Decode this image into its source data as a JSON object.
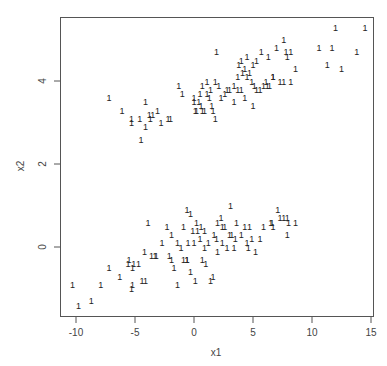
{
  "chart_data": {
    "type": "scatter",
    "title": "",
    "xlabel": "x1",
    "ylabel": "x2",
    "xlim": [
      -11.5,
      15.3
    ],
    "ylim": [
      -1.7,
      5.5
    ],
    "xticks": [
      -10,
      -5,
      0,
      5,
      10,
      15
    ],
    "yticks": [
      0,
      2,
      4
    ],
    "grid": false,
    "legend": null,
    "marker": "1",
    "series": [
      {
        "name": "upper cluster",
        "points": [
          [
            -7.2,
            3.6
          ],
          [
            -6.1,
            3.3
          ],
          [
            -5.3,
            3.1
          ],
          [
            -5.3,
            3.0
          ],
          [
            -4.6,
            3.1
          ],
          [
            -4.1,
            3.5
          ],
          [
            -4.1,
            2.9
          ],
          [
            -3.8,
            3.2
          ],
          [
            -3.7,
            3.1
          ],
          [
            -3.5,
            3.2
          ],
          [
            -3.1,
            3.3
          ],
          [
            -2.8,
            3.0
          ],
          [
            -2.2,
            3.1
          ],
          [
            -2.0,
            3.1
          ],
          [
            -4.5,
            2.6
          ],
          [
            -1.3,
            3.9
          ],
          [
            -1.0,
            3.7
          ],
          [
            0.0,
            3.6
          ],
          [
            0.0,
            3.5
          ],
          [
            0.1,
            3.3
          ],
          [
            0.2,
            3.3
          ],
          [
            0.4,
            3.5
          ],
          [
            0.6,
            3.4
          ],
          [
            0.7,
            3.3
          ],
          [
            0.9,
            3.3
          ],
          [
            1.1,
            3.7
          ],
          [
            1.3,
            3.6
          ],
          [
            1.5,
            3.4
          ],
          [
            1.6,
            3.3
          ],
          [
            1.8,
            3.1
          ],
          [
            0.5,
            3.7
          ],
          [
            0.7,
            3.9
          ],
          [
            1.1,
            4.0
          ],
          [
            1.4,
            3.8
          ],
          [
            1.8,
            4.0
          ],
          [
            2.1,
            3.9
          ],
          [
            2.3,
            3.6
          ],
          [
            2.6,
            3.7
          ],
          [
            2.8,
            3.8
          ],
          [
            3.0,
            3.8
          ],
          [
            3.4,
            3.5
          ],
          [
            3.4,
            3.9
          ],
          [
            3.7,
            3.8
          ],
          [
            4.0,
            3.8
          ],
          [
            4.3,
            3.6
          ],
          [
            1.9,
            4.7
          ],
          [
            3.8,
            4.4
          ],
          [
            4.1,
            4.2
          ],
          [
            4.3,
            4.3
          ],
          [
            4.5,
            4.1
          ],
          [
            4.7,
            4.2
          ],
          [
            4.9,
            4.0
          ],
          [
            5.1,
            3.9
          ],
          [
            5.3,
            3.8
          ],
          [
            5.6,
            3.8
          ],
          [
            5.9,
            3.9
          ],
          [
            6.1,
            4.0
          ],
          [
            6.2,
            3.9
          ],
          [
            6.4,
            3.9
          ],
          [
            6.7,
            4.1
          ],
          [
            3.7,
            4.1
          ],
          [
            4.0,
            4.5
          ],
          [
            4.5,
            4.6
          ],
          [
            5.0,
            4.4
          ],
          [
            5.3,
            4.5
          ],
          [
            5.7,
            4.7
          ],
          [
            6.3,
            4.6
          ],
          [
            7.0,
            4.8
          ],
          [
            7.6,
            5.0
          ],
          [
            7.8,
            4.7
          ],
          [
            7.9,
            4.6
          ],
          [
            8.2,
            4.7
          ],
          [
            8.6,
            4.3
          ],
          [
            10.6,
            4.8
          ],
          [
            11.7,
            4.8
          ],
          [
            7.3,
            4.0
          ],
          [
            7.6,
            4.0
          ],
          [
            8.2,
            4.0
          ],
          [
            5.0,
            3.4
          ],
          [
            6.7,
            4.1
          ],
          [
            11.3,
            4.4
          ],
          [
            12.5,
            4.3
          ],
          [
            13.8,
            4.7
          ],
          [
            12.0,
            5.3
          ],
          [
            14.5,
            5.3
          ]
        ]
      },
      {
        "name": "lower cluster",
        "points": [
          [
            -10.3,
            -0.9
          ],
          [
            -9.8,
            -1.4
          ],
          [
            -8.7,
            -1.3
          ],
          [
            -7.9,
            -0.9
          ],
          [
            -7.2,
            -0.5
          ],
          [
            -6.3,
            -0.7
          ],
          [
            -5.6,
            -0.4
          ],
          [
            -5.5,
            -0.3
          ],
          [
            -5.2,
            -0.5
          ],
          [
            -5.1,
            -0.4
          ],
          [
            -5.2,
            -0.9
          ],
          [
            -5.3,
            -1.0
          ],
          [
            -4.7,
            -0.4
          ],
          [
            -4.4,
            -0.8
          ],
          [
            -4.1,
            -0.8
          ],
          [
            -3.9,
            0.6
          ],
          [
            -4.2,
            -0.1
          ],
          [
            -3.6,
            -0.2
          ],
          [
            -3.3,
            -0.2
          ],
          [
            -3.2,
            -0.2
          ],
          [
            -2.7,
            0.1
          ],
          [
            -2.3,
            0.5
          ],
          [
            -2.1,
            -0.2
          ],
          [
            -1.9,
            -0.3
          ],
          [
            -1.9,
            0.3
          ],
          [
            -1.7,
            -0.5
          ],
          [
            -1.4,
            0.1
          ],
          [
            -1.1,
            0.0
          ],
          [
            -0.9,
            -0.3
          ],
          [
            -0.6,
            -0.3
          ],
          [
            -0.9,
            0.5
          ],
          [
            -0.6,
            0.9
          ],
          [
            -0.3,
            0.8
          ],
          [
            -0.5,
            0.1
          ],
          [
            -0.6,
            -0.3
          ],
          [
            -0.3,
            -0.6
          ],
          [
            -0.1,
            0.4
          ],
          [
            0.0,
            0.1
          ],
          [
            0.2,
            0.6
          ],
          [
            0.3,
            0.4
          ],
          [
            0.5,
            0.2
          ],
          [
            0.6,
            0.5
          ],
          [
            0.9,
            0.4
          ],
          [
            0.9,
            0.0
          ],
          [
            -1.4,
            -0.9
          ],
          [
            1.0,
            -0.4
          ],
          [
            1.2,
            0.1
          ],
          [
            1.4,
            -0.8
          ],
          [
            1.6,
            -0.7
          ],
          [
            1.9,
            0.2
          ],
          [
            2.0,
            -0.1
          ],
          [
            2.3,
            0.7
          ],
          [
            2.4,
            0.1
          ],
          [
            2.6,
            0.5
          ],
          [
            2.8,
            0.0
          ],
          [
            3.0,
            0.3
          ],
          [
            3.2,
            0.3
          ],
          [
            3.4,
            0.0
          ],
          [
            3.5,
            0.2
          ],
          [
            3.6,
            0.6
          ],
          [
            3.1,
            1.0
          ],
          [
            4.0,
            0.3
          ],
          [
            4.3,
            0.5
          ],
          [
            4.5,
            0.1
          ],
          [
            4.6,
            0.0
          ],
          [
            4.7,
            0.5
          ],
          [
            4.9,
            0.2
          ],
          [
            5.2,
            -0.1
          ],
          [
            5.6,
            0.2
          ],
          [
            5.9,
            0.5
          ],
          [
            6.6,
            0.6
          ],
          [
            6.7,
            0.5
          ],
          [
            7.1,
            0.9
          ],
          [
            7.3,
            0.7
          ],
          [
            7.6,
            0.7
          ],
          [
            7.9,
            0.7
          ],
          [
            8.0,
            0.6
          ],
          [
            8.6,
            0.6
          ],
          [
            7.9,
            0.3
          ],
          [
            6.5,
            0.6
          ],
          [
            2.0,
            0.6
          ],
          [
            2.4,
            0.5
          ],
          [
            1.7,
            0.3
          ],
          [
            0.7,
            -0.3
          ],
          [
            0.1,
            -0.8
          ]
        ]
      }
    ]
  },
  "axes": {
    "x_label": "x1",
    "y_label": "x2",
    "x_tick_labels": [
      "-10",
      "-5",
      "0",
      "5",
      "10",
      "15"
    ],
    "y_tick_labels": [
      "0",
      "2",
      "4"
    ]
  }
}
